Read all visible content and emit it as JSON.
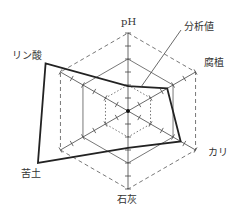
{
  "chart_data": {
    "type": "radar",
    "title": "",
    "axes": [
      "pH",
      "腐植",
      "カリ",
      "石灰",
      "苦土",
      "リン酸"
    ],
    "rings": [
      {
        "level": 1,
        "style": "dotted"
      },
      {
        "level": 2,
        "style": "solid"
      },
      {
        "level": 3,
        "style": "dashed"
      }
    ],
    "range": [
      0,
      3
    ],
    "series": [
      {
        "name": "分析値",
        "values": [
          0.96,
          1.74,
          2.34,
          1.42,
          4.0,
          3.66
        ]
      }
    ],
    "annotations": [
      {
        "text": "分析値",
        "points_to": "series line"
      }
    ],
    "ticks_per_ring": 2
  },
  "labels": {
    "ph": "pH",
    "humus": "腐植",
    "potash": "カリ",
    "lime": "石灰",
    "magnesia": "苦土",
    "phosphate": "リン酸",
    "analysis": "分析値"
  },
  "colors": {
    "series": "#222222",
    "grid": "#555555",
    "text": "#333333"
  }
}
